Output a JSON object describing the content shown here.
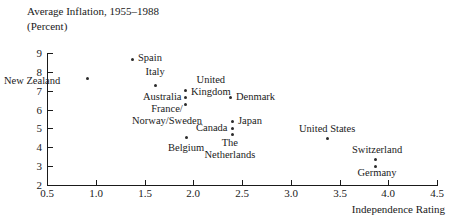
{
  "title": {
    "line1": "Average Inflation, 1955–1988",
    "line2": "(Percent)"
  },
  "axes": {
    "x_title": "Independence Rating",
    "x_ticks": [
      "0.5",
      "1.0",
      "1.5",
      "2.0",
      "2.5",
      "3.0",
      "3.5",
      "4.0",
      "4.5"
    ],
    "y_ticks": [
      "9",
      "8",
      "7",
      "6",
      "5",
      "4",
      "3",
      "2"
    ]
  },
  "chart_data": {
    "type": "scatter",
    "xlabel": "Independence Rating",
    "ylabel": "Average Inflation, 1955-1988 (Percent)",
    "xlim": [
      0.5,
      4.5
    ],
    "ylim": [
      2,
      9
    ],
    "xticks": [
      0.5,
      1.0,
      1.5,
      2.0,
      2.5,
      3.0,
      3.5,
      4.0,
      4.5
    ],
    "yticks": [
      2,
      3,
      4,
      5,
      6,
      7,
      8,
      9
    ],
    "grid": false,
    "legend": null,
    "marker_color": "#2b2b2b",
    "points": [
      {
        "label": "New Zealand",
        "x": 1.0,
        "y": 7.7,
        "px": 87,
        "py": 78,
        "label_px": 60,
        "label_py": 75,
        "label_align": "right",
        "lines": [
          "New Zealand"
        ]
      },
      {
        "label": "Spain",
        "x": 1.4,
        "y": 8.7,
        "px": 132,
        "py": 59,
        "label_px": 138,
        "label_py": 52,
        "label_align": "left",
        "lines": [
          "Spain"
        ]
      },
      {
        "label": "Italy",
        "x": 1.65,
        "y": 7.3,
        "px": 155,
        "py": 85,
        "label_px": 155,
        "label_py": 66,
        "label_align": "center",
        "lines": [
          "Italy"
        ]
      },
      {
        "label": "United Kingdom",
        "x": 1.92,
        "y": 7.05,
        "px": 185,
        "py": 90,
        "label_px": 191,
        "label_py": 74,
        "label_align": "left",
        "lines": [
          "United",
          "Kingdom"
        ]
      },
      {
        "label": "Australia",
        "x": 1.92,
        "y": 6.65,
        "px": 185,
        "py": 97,
        "label_px": 182,
        "label_py": 91,
        "label_align": "right",
        "lines": [
          "Australia"
        ]
      },
      {
        "label": "France/Norway/Sweden",
        "x": 1.92,
        "y": 6.3,
        "px": 185,
        "py": 104,
        "label_px": 167,
        "label_py": 103,
        "label_align": "center",
        "lines": [
          "France/",
          "Norway/Sweden"
        ]
      },
      {
        "label": "Denmark",
        "x": 2.38,
        "y": 6.65,
        "px": 230,
        "py": 97,
        "label_px": 236,
        "label_py": 91,
        "label_align": "left",
        "lines": [
          "Denmark"
        ]
      },
      {
        "label": "Japan",
        "x": 2.4,
        "y": 5.4,
        "px": 232,
        "py": 121,
        "label_px": 238,
        "label_py": 115,
        "label_align": "left",
        "lines": [
          "Japan"
        ]
      },
      {
        "label": "Canada",
        "x": 2.4,
        "y": 5.05,
        "px": 232,
        "py": 128,
        "label_px": 228,
        "label_py": 122,
        "label_align": "right",
        "lines": [
          "Canada"
        ]
      },
      {
        "label": "The Netherlands",
        "x": 2.4,
        "y": 4.7,
        "px": 232,
        "py": 134,
        "label_px": 230,
        "label_py": 137,
        "label_align": "center",
        "lines": [
          "The",
          "Netherlands"
        ]
      },
      {
        "label": "Belgium",
        "x": 1.93,
        "y": 4.5,
        "px": 186,
        "py": 137,
        "label_px": 186,
        "label_py": 142,
        "label_align": "center",
        "lines": [
          "Belgium"
        ]
      },
      {
        "label": "United States",
        "x": 3.37,
        "y": 4.5,
        "px": 327,
        "py": 138,
        "label_px": 327,
        "label_py": 123,
        "label_align": "center",
        "lines": [
          "United States"
        ]
      },
      {
        "label": "Switzerland",
        "x": 4.0,
        "y": 3.4,
        "px": 375,
        "py": 159,
        "label_px": 377,
        "label_py": 144,
        "label_align": "center",
        "lines": [
          "Switzerland"
        ]
      },
      {
        "label": "Germany",
        "x": 4.0,
        "y": 3.0,
        "px": 375,
        "py": 166,
        "label_px": 377,
        "label_py": 167,
        "label_align": "center",
        "lines": [
          "Germany"
        ]
      }
    ]
  }
}
